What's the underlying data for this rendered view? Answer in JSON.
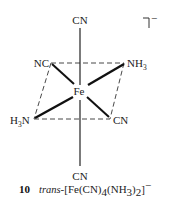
{
  "diagram": {
    "type": "octahedral-coordination-complex",
    "metal": "Fe",
    "charge": "−",
    "ligands": {
      "axial_top": "CN",
      "axial_bottom": "CN",
      "eq_back_left": "NC",
      "eq_back_right": "NH",
      "eq_back_right_sub": "3",
      "eq_front_left": "H",
      "eq_front_left_sub": "3",
      "eq_front_left_tail": "N",
      "eq_front_right": "CN"
    },
    "colors": {
      "ink": "#222222",
      "background": "#ffffff"
    }
  },
  "caption": {
    "number": "10",
    "prefix": "trans",
    "formula_part1": "-[Fe(CN)",
    "sub1": "4",
    "formula_part2": "(NH",
    "sub2": "3",
    "formula_part3": ")",
    "sub3": "2",
    "formula_part4": "]",
    "charge": "−"
  }
}
